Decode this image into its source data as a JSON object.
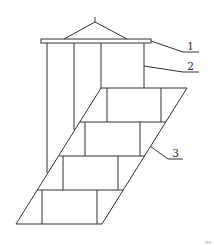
{
  "diagram": {
    "type": "technical line drawing",
    "labels": [
      {
        "id": "1",
        "text": "1",
        "points_to": "top cap plate"
      },
      {
        "id": "2",
        "text": "2",
        "points_to": "vertical column body"
      },
      {
        "id": "3",
        "text": "3",
        "points_to": "slanted stepped base"
      }
    ],
    "corner_mark": "¤¤",
    "stroke_color": "#333333",
    "background": "#ffffff"
  }
}
